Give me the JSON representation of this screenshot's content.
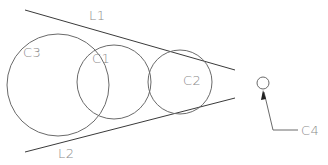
{
  "diagram": {
    "title": "",
    "lines": [
      {
        "id": "L1",
        "label": "L1",
        "role": "upper tangent line"
      },
      {
        "id": "L2",
        "label": "L2",
        "role": "lower tangent line"
      }
    ],
    "circles": [
      {
        "id": "C3",
        "label": "C3"
      },
      {
        "id": "C1",
        "label": "C1"
      },
      {
        "id": "C2",
        "label": "C2"
      },
      {
        "id": "C4",
        "label": "C4",
        "callout": true
      }
    ],
    "colors": {
      "background": "#ffffff",
      "stroke": "#6a6a6a",
      "line": "#3a3a3a",
      "label": "#8a8a8a"
    }
  }
}
